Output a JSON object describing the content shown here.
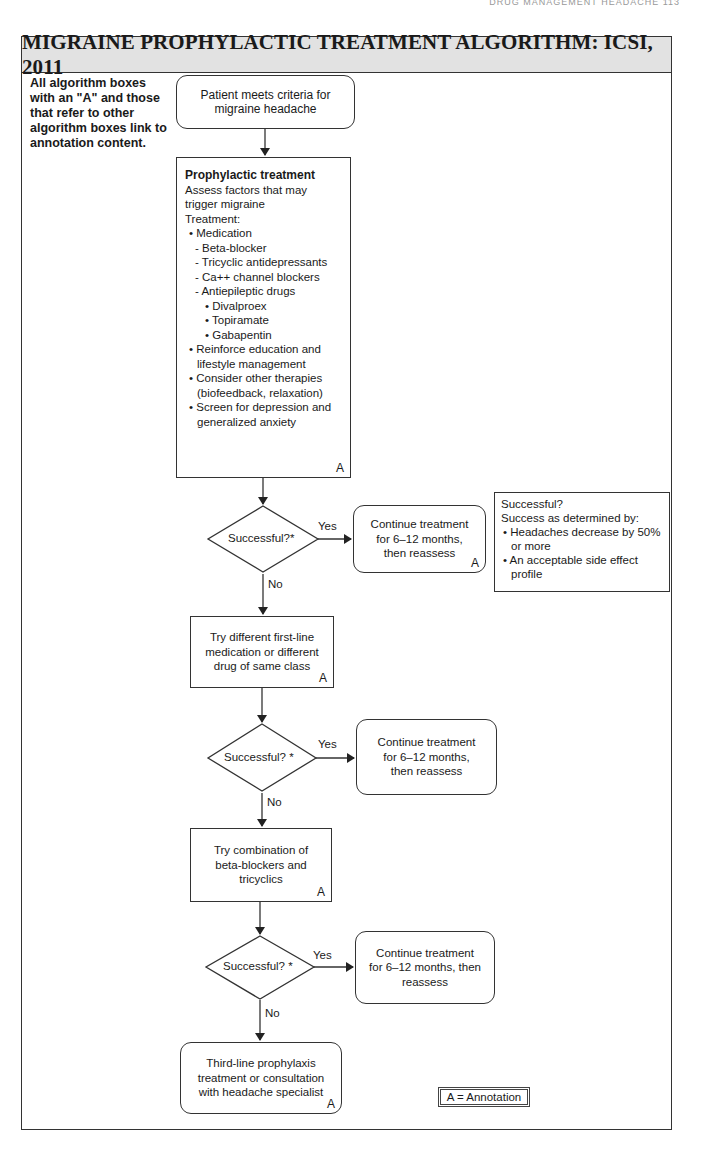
{
  "page": {
    "running_head": "DRUG MANAGEMENT HEADACHE  113"
  },
  "title": "MIGRAINE PROPHYLACTIC TREATMENT ALGORITHM: ICSI, 2011",
  "note": "All algorithm boxes with an \"A\" and those that refer to other algorithm boxes link to annotation content.",
  "annotation_marker": "A",
  "nodes": {
    "start": {
      "lines": [
        "Patient meets criteria for",
        "migraine headache"
      ]
    },
    "prophylactic": {
      "header": "Prophylactic treatment",
      "intro": [
        "Assess factors that may",
        "trigger migraine",
        "Treatment:"
      ],
      "items": [
        {
          "level": 1,
          "text": "• Medication"
        },
        {
          "level": 2,
          "text": "- Beta-blocker"
        },
        {
          "level": 2,
          "text": "- Tricyclic antidepressants"
        },
        {
          "level": 2,
          "text": "- Ca++ channel blockers"
        },
        {
          "level": 2,
          "text": "- Antiepileptic drugs"
        },
        {
          "level": 3,
          "text": "• Divalproex"
        },
        {
          "level": 3,
          "text": "• Topiramate"
        },
        {
          "level": 3,
          "text": "• Gabapentin"
        },
        {
          "level": 1,
          "text": "• Reinforce education and lifestyle management"
        },
        {
          "level": 1,
          "text": "• Consider other therapies (biofeedback, relaxation)"
        },
        {
          "level": 1,
          "text": "• Screen for depression and generalized anxiety"
        }
      ],
      "annotation": "A"
    },
    "decision1": {
      "label": "Successful?*",
      "yes": "Yes",
      "no": "No"
    },
    "continue1": {
      "lines": [
        "Continue treatment",
        "for 6–12 months,",
        "then reassess"
      ],
      "annotation": "A"
    },
    "try_different": {
      "lines": [
        "Try different first-line",
        "medication or different",
        "drug of same class"
      ],
      "annotation": "A"
    },
    "decision2": {
      "label": "Successful? *",
      "yes": "Yes",
      "no": "No"
    },
    "continue2": {
      "lines": [
        "Continue treatment",
        "for 6–12 months,",
        "then reassess"
      ]
    },
    "try_combination": {
      "lines": [
        "Try combination of",
        "beta-blockers and",
        "tricyclics"
      ],
      "annotation": "A"
    },
    "decision3": {
      "label": "Successful? *",
      "yes": "Yes",
      "no": "No"
    },
    "continue3": {
      "lines": [
        "Continue treatment",
        "for 6–12 months, then",
        "reassess"
      ]
    },
    "third_line": {
      "lines": [
        "Third-line prophylaxis",
        "treatment or consultation",
        "with headache specialist"
      ],
      "annotation": "A"
    }
  },
  "success_note": {
    "title": "Successful?",
    "subtitle": "Success as determined by:",
    "items": [
      "• Headaches decrease by 50% or more",
      "• An acceptable side effect profile"
    ]
  },
  "legend": "A = Annotation"
}
